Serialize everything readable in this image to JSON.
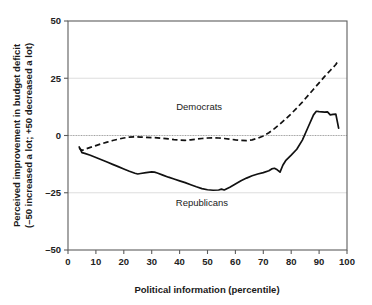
{
  "chart_data": {
    "type": "line",
    "title": "",
    "xlabel": "Political information (percentile)",
    "ylabel_line1": "Perceived improvement in budget deficit",
    "ylabel_line2": "(–50 increased a lot; +50 decreased a lot)",
    "xlim": [
      0,
      100
    ],
    "ylim": [
      -50,
      50
    ],
    "xticks": [
      0,
      10,
      20,
      30,
      40,
      50,
      60,
      70,
      80,
      90,
      100
    ],
    "xtick_labels": [
      "0",
      "10",
      "20",
      "30",
      "40",
      "50",
      "60",
      "70",
      "80",
      "90",
      "100"
    ],
    "yticks": [
      -50,
      -25,
      0,
      25,
      50
    ],
    "ytick_labels": [
      "–50",
      "–25",
      "0",
      "25",
      "50"
    ],
    "grid": "horizontal-light",
    "zero_reference_line": true,
    "legend_position": "inline-annotations",
    "series": [
      {
        "name": "Democrats",
        "style": "dashed",
        "color": "#111111",
        "label_x": 47,
        "label_y": 11,
        "x": [
          4,
          5,
          6,
          8,
          10,
          12,
          14,
          16,
          18,
          20,
          22,
          24,
          26,
          28,
          30,
          32,
          34,
          36,
          38,
          40,
          42,
          44,
          46,
          48,
          50,
          52,
          54,
          56,
          58,
          60,
          62,
          64,
          66,
          68,
          70,
          72,
          74,
          76,
          78,
          80,
          82,
          84,
          86,
          88,
          90,
          92,
          94,
          96,
          97
        ],
        "y": [
          -5.5,
          -6.5,
          -6.0,
          -5.2,
          -4.4,
          -3.6,
          -2.9,
          -2.2,
          -1.6,
          -1.1,
          -0.7,
          -0.6,
          -0.7,
          -0.8,
          -0.9,
          -1.0,
          -1.2,
          -1.5,
          -1.8,
          -2.0,
          -2.1,
          -1.9,
          -1.6,
          -1.3,
          -1.1,
          -1.0,
          -1.1,
          -1.3,
          -1.6,
          -1.9,
          -2.1,
          -2.2,
          -1.9,
          -1.2,
          -0.2,
          1.2,
          3.0,
          5.0,
          7.2,
          9.5,
          12.0,
          14.6,
          17.4,
          20.2,
          23.0,
          25.8,
          28.4,
          31.0,
          33.0
        ]
      },
      {
        "name": "Republicans",
        "style": "solid",
        "color": "#111111",
        "label_x": 48,
        "label_y": -31,
        "x": [
          4,
          5,
          6,
          8,
          10,
          12,
          14,
          16,
          18,
          20,
          22,
          24,
          25,
          26,
          28,
          30,
          31,
          32,
          34,
          36,
          38,
          40,
          42,
          44,
          46,
          48,
          50,
          52,
          54,
          55,
          56,
          58,
          60,
          62,
          64,
          66,
          68,
          70,
          72,
          73,
          74,
          75,
          76,
          77,
          78,
          80,
          82,
          84,
          86,
          88,
          89,
          90,
          92,
          93,
          94,
          95,
          96,
          97
        ],
        "y": [
          -5.0,
          -7.5,
          -7.8,
          -8.6,
          -9.6,
          -10.6,
          -11.6,
          -12.6,
          -13.6,
          -14.6,
          -15.6,
          -16.5,
          -16.8,
          -16.6,
          -16.2,
          -15.9,
          -16.0,
          -16.4,
          -17.3,
          -18.2,
          -19.0,
          -19.8,
          -20.6,
          -21.5,
          -22.4,
          -23.2,
          -23.7,
          -23.9,
          -23.8,
          -23.4,
          -23.8,
          -22.6,
          -21.2,
          -19.8,
          -18.6,
          -17.6,
          -16.8,
          -16.2,
          -15.4,
          -14.6,
          -14.3,
          -15.0,
          -16.0,
          -13.0,
          -11.0,
          -8.6,
          -6.0,
          -2.0,
          3.5,
          9.0,
          10.6,
          10.4,
          10.2,
          10.3,
          9.0,
          9.2,
          9.3,
          3.2
        ]
      }
    ]
  }
}
